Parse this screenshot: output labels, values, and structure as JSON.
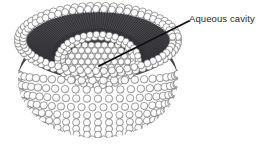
{
  "figure": {
    "kind": "liposome-cross-section-diagram",
    "background_color": "#ffffff",
    "annotations": [
      {
        "id": "aqueous-cavity",
        "label": "Aqueous cavity",
        "text_color": "#2b2b2b",
        "leader_line": {
          "from_x": 189,
          "from_y": 21,
          "to_x": 99,
          "to_y": 66,
          "color": "#111111"
        }
      }
    ],
    "structure": {
      "outer_sphere": {
        "center_x": 98,
        "center_y": 80,
        "radius_x": 80,
        "radius_y": 58,
        "rim_center_y": 40,
        "head_color": "#ffffff",
        "head_outline_color": "#555555"
      },
      "inner_cavity": {
        "center_x": 98,
        "center_y": 62,
        "radius_x": 36,
        "radius_y": 23,
        "fill_color": "#f2f2f2"
      },
      "tail_layer": {
        "color": "#3a3a3a",
        "description": "dark hydrophobic hydrocarbon tails between the two head-group leaflets"
      }
    }
  }
}
